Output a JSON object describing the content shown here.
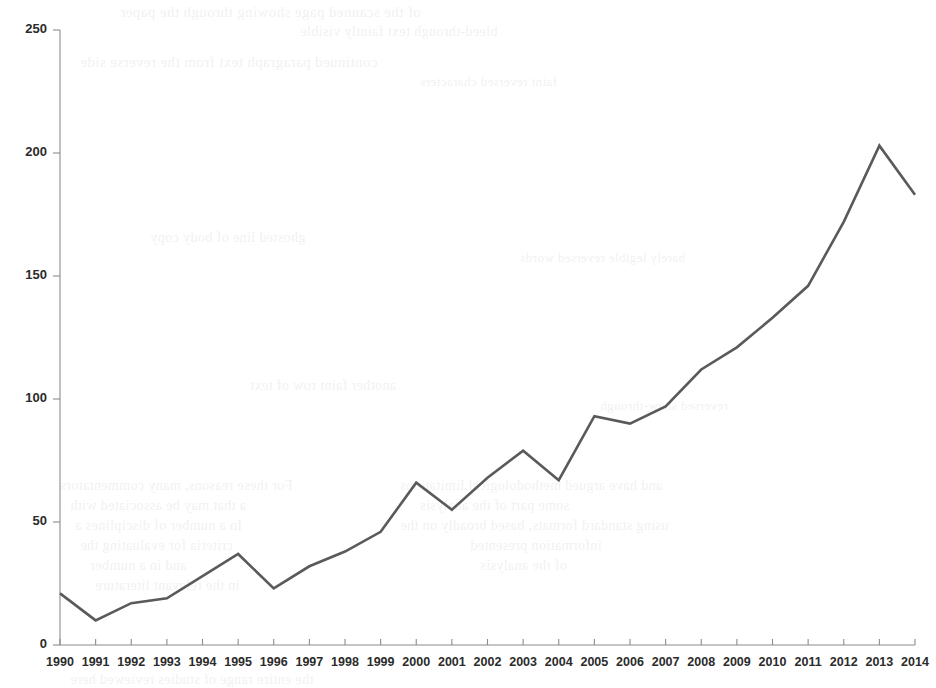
{
  "page": {
    "background_color": "#ffffff",
    "width": 936,
    "height": 688
  },
  "ghost_text": {
    "note": "faint bleed-through text from reverse side of scanned page, largely illegible",
    "opacity": 0.055,
    "lines": [
      {
        "text": "of the scanned page showing through the paper",
        "x": 120,
        "y": 4,
        "size": 15
      },
      {
        "text": "bleed-through text faintly visible",
        "x": 300,
        "y": 24,
        "size": 14
      },
      {
        "text": "continued paragraph text from the reverse side",
        "x": 80,
        "y": 54,
        "size": 15
      },
      {
        "text": "faint reversed characters",
        "x": 420,
        "y": 74,
        "size": 13
      },
      {
        "text": "ghosted line of body copy",
        "x": 150,
        "y": 230,
        "size": 14
      },
      {
        "text": "barely legible reversed words",
        "x": 520,
        "y": 250,
        "size": 13
      },
      {
        "text": "another faint row of text",
        "x": 250,
        "y": 378,
        "size": 14
      },
      {
        "text": "reversed show-through",
        "x": 600,
        "y": 398,
        "size": 13
      },
      {
        "text": "For these reasons, many commentators",
        "x": 60,
        "y": 478,
        "size": 14
      },
      {
        "text": "and have argued methodological limitations",
        "x": 400,
        "y": 478,
        "size": 14
      },
      {
        "text": "a that may be associated with",
        "x": 70,
        "y": 498,
        "size": 14
      },
      {
        "text": "some part of the analysis",
        "x": 420,
        "y": 498,
        "size": 14
      },
      {
        "text": "In a number of disciplines a",
        "x": 75,
        "y": 518,
        "size": 14
      },
      {
        "text": "using standard formats, based broadly on the",
        "x": 400,
        "y": 518,
        "size": 14
      },
      {
        "text": "criteria for evaluating the",
        "x": 80,
        "y": 538,
        "size": 14
      },
      {
        "text": "information presented",
        "x": 470,
        "y": 538,
        "size": 14
      },
      {
        "text": "and in a number",
        "x": 90,
        "y": 558,
        "size": 14
      },
      {
        "text": "of the analysis",
        "x": 480,
        "y": 558,
        "size": 14
      },
      {
        "text": "in the relevant literature",
        "x": 95,
        "y": 578,
        "size": 14
      },
      {
        "text": "the entire range of studies reviewed here",
        "x": 70,
        "y": 672,
        "size": 14
      }
    ]
  },
  "chart_data": {
    "type": "line",
    "title": "",
    "subtitle": "",
    "xlabel": "",
    "ylabel": "",
    "grid": false,
    "legend": false,
    "legend_position": "none",
    "line_color": "#5a5a5a",
    "axis_color": "#8c8c8c",
    "xlim": [
      1990,
      2014
    ],
    "ylim": [
      0,
      250
    ],
    "ytick_labels": [
      "0",
      "50",
      "100",
      "150",
      "200",
      "250"
    ],
    "yticks": [
      0,
      50,
      100,
      150,
      200,
      250
    ],
    "categories": [
      "1990",
      "1991",
      "1992",
      "1993",
      "1994",
      "1995",
      "1996",
      "1997",
      "1998",
      "1999",
      "2000",
      "2001",
      "2002",
      "2003",
      "2004",
      "2005",
      "2006",
      "2007",
      "2008",
      "2009",
      "2010",
      "2011",
      "2012",
      "2013",
      "2014"
    ],
    "x": [
      1990,
      1991,
      1992,
      1993,
      1994,
      1995,
      1996,
      1997,
      1998,
      1999,
      2000,
      2001,
      2002,
      2003,
      2004,
      2005,
      2006,
      2007,
      2008,
      2009,
      2010,
      2011,
      2012,
      2013,
      2014
    ],
    "values": [
      21,
      10,
      17,
      19,
      28,
      37,
      23,
      32,
      38,
      46,
      66,
      55,
      68,
      79,
      67,
      93,
      90,
      97,
      112,
      121,
      133,
      146,
      172,
      203,
      183
    ],
    "series": [
      {
        "name": "publications",
        "color": "#5a5a5a",
        "values": [
          21,
          10,
          17,
          19,
          28,
          37,
          23,
          32,
          38,
          46,
          66,
          55,
          68,
          79,
          67,
          93,
          90,
          97,
          112,
          121,
          133,
          146,
          172,
          203,
          183
        ]
      }
    ]
  }
}
